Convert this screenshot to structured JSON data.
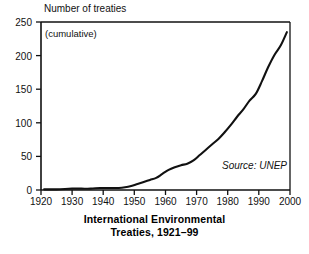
{
  "chart_data": {
    "type": "line",
    "title": "International Environmental Treaties, 1921–99",
    "title_line1": "International Environmental",
    "title_line2": "Treaties, 1921–99",
    "ylabel": "Number of treaties",
    "ylabel_note": "(cumulative)",
    "xlabel": "",
    "source": "Source: UNEP",
    "grid": false,
    "legend": null,
    "xlim": [
      1920,
      2000
    ],
    "ylim": [
      0,
      250
    ],
    "xticks": [
      1920,
      1930,
      1940,
      1950,
      1960,
      1970,
      1980,
      1990,
      2000
    ],
    "xtick_labels": [
      "1920",
      "1930",
      "1940",
      "1950",
      "1960",
      "1970",
      "1980",
      "1990",
      "2000"
    ],
    "yticks": [
      0,
      50,
      100,
      150,
      200,
      250
    ],
    "ytick_labels": [
      "0",
      "50",
      "100",
      "150",
      "200",
      "250"
    ],
    "line_color": "#111111",
    "series": [
      {
        "name": "Cumulative international environmental treaties",
        "x": [
          1921,
          1925,
          1930,
          1933,
          1936,
          1939,
          1942,
          1945,
          1947,
          1949,
          1951,
          1953,
          1955,
          1957,
          1959,
          1961,
          1963,
          1965,
          1967,
          1969,
          1971,
          1973,
          1975,
          1977,
          1979,
          1981,
          1983,
          1985,
          1987,
          1989,
          1991,
          1993,
          1995,
          1997,
          1999
        ],
        "values": [
          1,
          1,
          2,
          2,
          2,
          3,
          3,
          3,
          4,
          6,
          9,
          12,
          15,
          18,
          24,
          30,
          34,
          37,
          39,
          44,
          52,
          60,
          68,
          76,
          86,
          97,
          109,
          120,
          133,
          143,
          162,
          183,
          201,
          215,
          235
        ]
      }
    ]
  },
  "axis": {
    "y_title": "Number of treaties",
    "cumulative_note": "(cumulative)"
  },
  "annotations": {
    "source": "Source: UNEP"
  },
  "caption": {
    "line1": "International Environmental",
    "line2": "Treaties, 1921–99"
  }
}
